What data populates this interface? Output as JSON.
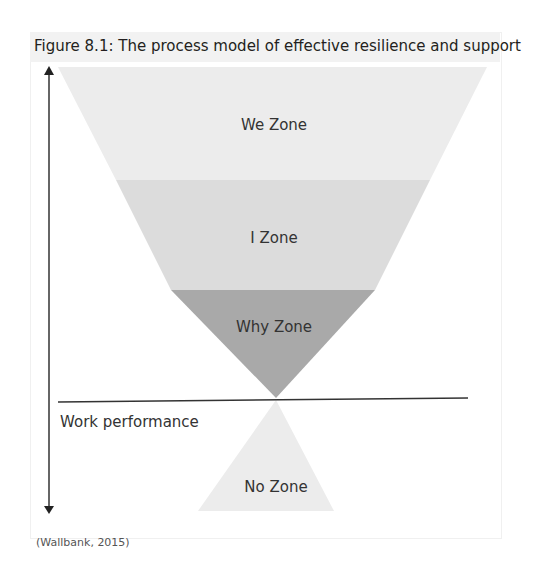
{
  "figure": {
    "title": "Figure 8.1: The process model of effective resilience and support",
    "source": "(Wallbank, 2015)"
  },
  "zones": [
    {
      "label": "We Zone",
      "color": "#ececec"
    },
    {
      "label": "I Zone",
      "color": "#dcdcdc"
    },
    {
      "label": "Why Zone",
      "color": "#a9a9a9"
    },
    {
      "label": "No Zone",
      "color": "#ececec"
    }
  ],
  "axis": {
    "horizontal_label": "Work performance",
    "vertical_arrow": "double-headed"
  }
}
